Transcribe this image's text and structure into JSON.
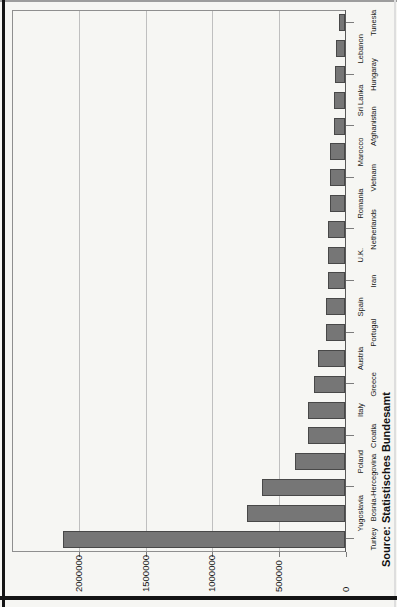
{
  "page": {
    "kind": "scanned portrait page with bar chart rotated 90 degrees counter-clockwise"
  },
  "colors": {
    "page_background": "#f6f6f3",
    "bar_fill": "#767676",
    "bar_border": "#484848",
    "gridline": "#bfbfbf",
    "plot_frame": "#8f8f8f",
    "axis_line": "#5a5a5a",
    "text": "#161616",
    "page_edge": "#141414"
  },
  "chart_data": {
    "type": "bar",
    "title": "",
    "xlabel": "",
    "ylabel": "",
    "categories": [
      "Turkey",
      "Yugoslavia",
      "Bosnia-Hercegovina",
      "Poland",
      "Croatia",
      "Italy",
      "Greece",
      "Austria",
      "Portugal",
      "Spain",
      "Iran",
      "U.K.",
      "Netherlands",
      "Romania",
      "Vietnam",
      "Marocco",
      "Afghanistan",
      "Sri Lanka",
      "Hungaray",
      "Lebanon",
      "Tunesia"
    ],
    "values": [
      2110000,
      730000,
      620000,
      375000,
      280000,
      275000,
      230000,
      200000,
      140000,
      140000,
      125000,
      125000,
      125000,
      110000,
      110000,
      110000,
      85000,
      85000,
      75000,
      70000,
      45000
    ],
    "ylim": [
      0,
      2500000
    ],
    "y_ticks": [
      0,
      500000,
      1000000,
      1500000,
      2000000
    ],
    "y_tick_labels": [
      "0",
      "500000",
      "1000000",
      "1500000",
      "2000000"
    ],
    "grid": true,
    "legend_position": "none",
    "layout_hints": "vertical bars, category labels staggered in two rows below axis, whole chart rotated 90deg CCW on portrait page, y tick labels left-aligned in margin",
    "source_note": "Source: Statistisches Bundesamt"
  }
}
